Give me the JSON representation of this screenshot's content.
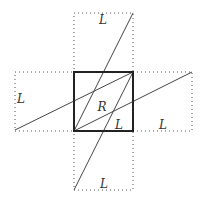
{
  "diagram": {
    "colors": {
      "background": "#ffffff",
      "square_stroke": "#222222",
      "dotted_stroke": "#555555",
      "line_stroke": "#444444",
      "label": "#333333"
    },
    "central_square": {
      "x": 74,
      "y": 72,
      "size": 59,
      "label": "R"
    },
    "rectangles": [
      {
        "name": "top",
        "x": 74,
        "y": 13,
        "w": 59,
        "h": 59,
        "label": "L"
      },
      {
        "name": "left",
        "x": 15,
        "y": 72,
        "w": 59,
        "h": 59,
        "label": "L"
      },
      {
        "name": "right",
        "x": 133,
        "y": 72,
        "w": 59,
        "h": 59,
        "label": "L"
      },
      {
        "name": "bottom",
        "x": 74,
        "y": 131,
        "w": 59,
        "h": 59,
        "label": "L"
      }
    ],
    "lines": [
      {
        "x1": 15,
        "y1": 130,
        "x2": 133,
        "y2": 72
      },
      {
        "x1": 74,
        "y1": 131,
        "x2": 192,
        "y2": 72
      },
      {
        "x1": 74,
        "y1": 131,
        "x2": 133,
        "y2": 13
      },
      {
        "x1": 74,
        "y1": 190,
        "x2": 133,
        "y2": 72
      }
    ],
    "labels": {
      "top": {
        "text": "L",
        "x": 103,
        "y": 20
      },
      "left": {
        "text": "L",
        "x": 21,
        "y": 99
      },
      "right": {
        "text": "L",
        "x": 163,
        "y": 125
      },
      "bottom": {
        "text": "L",
        "x": 104,
        "y": 184
      },
      "inner_l": {
        "text": "L",
        "x": 119,
        "y": 125
      },
      "center": {
        "text": "R",
        "x": 102,
        "y": 107
      }
    }
  }
}
